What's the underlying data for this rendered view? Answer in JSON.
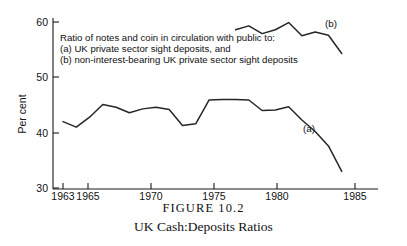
{
  "caption": {
    "figure_number": "FIGURE 10.2",
    "title": "UK Cash:Deposits Ratios"
  },
  "axes": {
    "ylabel": "Per cent",
    "xlabel": "",
    "yticks": [
      "30",
      "40",
      "50",
      "60"
    ],
    "xticks": [
      "1963",
      "1965",
      "1970",
      "1975",
      "1980",
      "1985"
    ]
  },
  "legend": {
    "line1": "Ratio of notes and coin in circulation with public to:",
    "line2": "(a) UK private sector sight deposits, and",
    "line3": "(b) non-interest-bearing UK private sector sight deposits"
  },
  "series_labels": {
    "a": "(a)",
    "b": "(b)"
  },
  "colors": {
    "curve": "#262626",
    "axis": "#1a1a1a",
    "text": "#111111",
    "background": "#ffffff"
  },
  "chart_data": {
    "type": "line",
    "title": "UK Cash:Deposits Ratios",
    "subtitle": "FIGURE 10.2",
    "xlabel": "",
    "ylabel": "Per cent",
    "xlim": [
      1963,
      1985
    ],
    "ylim": [
      30,
      60
    ],
    "grid": false,
    "legend_position": "inline-annotation",
    "annotations": [
      "Ratio of notes and coin in circulation with public to:",
      "(a) UK private sector sight deposits, and",
      "(b) non-interest-bearing UK private sector sight deposits"
    ],
    "series": [
      {
        "name": "(a) UK private sector sight deposits",
        "label": "(a)",
        "x": [
          1963,
          1964,
          1965,
          1966,
          1967,
          1968,
          1969,
          1970,
          1971,
          1972,
          1973,
          1974,
          1975,
          1976,
          1977,
          1978,
          1979,
          1980,
          1981,
          1982,
          1983,
          1984
        ],
        "values": [
          42.0,
          41.0,
          42.8,
          45.1,
          44.6,
          43.6,
          44.3,
          44.6,
          44.2,
          41.3,
          41.6,
          45.9,
          46.0,
          46.0,
          45.9,
          44.0,
          44.1,
          44.7,
          42.3,
          40.2,
          37.6,
          33.0
        ]
      },
      {
        "name": "(b) non-interest-bearing UK private sector sight deposits",
        "label": "(b)",
        "x": [
          1976,
          1977,
          1978,
          1979,
          1980,
          1981,
          1982,
          1983,
          1984
        ],
        "values": [
          58.6,
          59.3,
          57.9,
          58.6,
          59.9,
          57.5,
          58.2,
          57.6,
          54.3
        ]
      }
    ]
  }
}
